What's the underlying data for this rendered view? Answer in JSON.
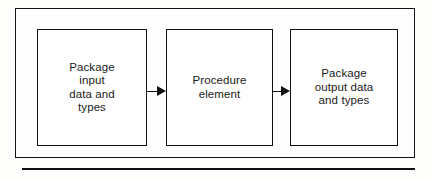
{
  "figure": {
    "nodes": [
      {
        "id": "package-input",
        "label": "Package\ninput\ndata and\ntypes"
      },
      {
        "id": "procedure-element",
        "label": "Procedure\nelement"
      },
      {
        "id": "package-output",
        "label": "Package\noutput data\nand types"
      }
    ],
    "connectors": [
      {
        "id": "arrow-input-to-procedure",
        "from": "package-input",
        "to": "procedure-element",
        "direction": "right"
      },
      {
        "id": "arrow-procedure-to-output",
        "from": "procedure-element",
        "to": "package-output",
        "direction": "right"
      }
    ],
    "colors": {
      "stroke": "#111111",
      "frame": "#141414",
      "node_fill": "#ffffff",
      "background": "#fdfdfb",
      "text": "#1a1a1a"
    }
  }
}
